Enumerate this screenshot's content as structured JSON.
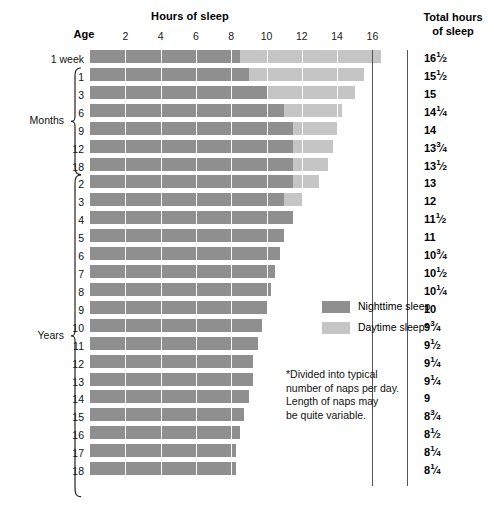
{
  "header": {
    "hours_title": "Hours of sleep",
    "age_title": "Age",
    "total_title_line1": "Total hours",
    "total_title_line2": "of sleep"
  },
  "legend": {
    "nighttime_label": "Nighttime sleep",
    "daytime_label": "Daytime sleep*",
    "nighttime_color": "#8f8f8f",
    "daytime_color": "#c5c5c5"
  },
  "footnote": {
    "line1": "*Divided into typical",
    "line2": "number of naps per day.",
    "line3": "Length of naps may",
    "line4": "be quite variable."
  },
  "groups": [
    {
      "label": "Months",
      "first_row": 1,
      "last_row": 6
    },
    {
      "label": "Years",
      "first_row": 7,
      "last_row": 24
    }
  ],
  "chart_data": {
    "type": "bar",
    "title": "Hours of sleep",
    "xlabel": "Hours of sleep",
    "ylabel": "Age",
    "xlim": [
      0,
      17
    ],
    "xticks": [
      2,
      4,
      6,
      8,
      10,
      12,
      14,
      16
    ],
    "grid": true,
    "stacked": true,
    "legend_position": "middle-right",
    "series": [
      {
        "name": "Nighttime sleep",
        "color": "#8f8f8f"
      },
      {
        "name": "Daytime sleep*",
        "color": "#c5c5c5"
      }
    ],
    "categories": [
      "1 week",
      "1",
      "3",
      "6",
      "9",
      "12",
      "18",
      "2",
      "3",
      "4",
      "5",
      "6",
      "7",
      "8",
      "9",
      "10",
      "11",
      "12",
      "13",
      "14",
      "15",
      "16",
      "17",
      "18"
    ],
    "rows": [
      {
        "age": "1 week",
        "group": "",
        "night": 8.5,
        "day": 8,
        "total": 16.5,
        "total_label": "16½",
        "total_whole": "16",
        "total_num": "1",
        "total_den": "2"
      },
      {
        "age": "1",
        "group": "Months",
        "night": 9,
        "day": 6.5,
        "total": 15.5,
        "total_label": "15½",
        "total_whole": "15",
        "total_num": "1",
        "total_den": "2"
      },
      {
        "age": "3",
        "group": "Months",
        "night": 10,
        "day": 5,
        "total": 15,
        "total_label": "15",
        "total_whole": "15",
        "total_num": "",
        "total_den": ""
      },
      {
        "age": "6",
        "group": "Months",
        "night": 11,
        "day": 3.25,
        "total": 14.25,
        "total_label": "14¼",
        "total_whole": "14",
        "total_num": "1",
        "total_den": "4"
      },
      {
        "age": "9",
        "group": "Months",
        "night": 11.5,
        "day": 2.5,
        "total": 14,
        "total_label": "14",
        "total_whole": "14",
        "total_num": "",
        "total_den": ""
      },
      {
        "age": "12",
        "group": "Months",
        "night": 11.5,
        "day": 2.25,
        "total": 13.75,
        "total_label": "13¾",
        "total_whole": "13",
        "total_num": "3",
        "total_den": "4"
      },
      {
        "age": "18",
        "group": "Months",
        "night": 11.5,
        "day": 2,
        "total": 13.5,
        "total_label": "13½",
        "total_whole": "13",
        "total_num": "1",
        "total_den": "2"
      },
      {
        "age": "2",
        "group": "Years",
        "night": 11.5,
        "day": 1.5,
        "total": 13,
        "total_label": "13",
        "total_whole": "13",
        "total_num": "",
        "total_den": ""
      },
      {
        "age": "3",
        "group": "Years",
        "night": 11,
        "day": 1,
        "total": 12,
        "total_label": "12",
        "total_whole": "12",
        "total_num": "",
        "total_den": ""
      },
      {
        "age": "4",
        "group": "Years",
        "night": 11.5,
        "day": 0,
        "total": 11.5,
        "total_label": "11½",
        "total_whole": "11",
        "total_num": "1",
        "total_den": "2"
      },
      {
        "age": "5",
        "group": "Years",
        "night": 11,
        "day": 0,
        "total": 11,
        "total_label": "11",
        "total_whole": "11",
        "total_num": "",
        "total_den": ""
      },
      {
        "age": "6",
        "group": "Years",
        "night": 10.75,
        "day": 0,
        "total": 10.75,
        "total_label": "10¾",
        "total_whole": "10",
        "total_num": "3",
        "total_den": "4"
      },
      {
        "age": "7",
        "group": "Years",
        "night": 10.5,
        "day": 0,
        "total": 10.5,
        "total_label": "10½",
        "total_whole": "10",
        "total_num": "1",
        "total_den": "2"
      },
      {
        "age": "8",
        "group": "Years",
        "night": 10.25,
        "day": 0,
        "total": 10.25,
        "total_label": "10¼",
        "total_whole": "10",
        "total_num": "1",
        "total_den": "4"
      },
      {
        "age": "9",
        "group": "Years",
        "night": 10,
        "day": 0,
        "total": 10,
        "total_label": "10",
        "total_whole": "10",
        "total_num": "",
        "total_den": ""
      },
      {
        "age": "10",
        "group": "Years",
        "night": 9.75,
        "day": 0,
        "total": 9.75,
        "total_label": "9¾",
        "total_whole": "9",
        "total_num": "3",
        "total_den": "4"
      },
      {
        "age": "11",
        "group": "Years",
        "night": 9.5,
        "day": 0,
        "total": 9.5,
        "total_label": "9½",
        "total_whole": "9",
        "total_num": "1",
        "total_den": "2"
      },
      {
        "age": "12",
        "group": "Years",
        "night": 9.25,
        "day": 0,
        "total": 9.25,
        "total_label": "9¼",
        "total_whole": "9",
        "total_num": "1",
        "total_den": "4"
      },
      {
        "age": "13",
        "group": "Years",
        "night": 9.25,
        "day": 0,
        "total": 9.25,
        "total_label": "9¼",
        "total_whole": "9",
        "total_num": "1",
        "total_den": "4"
      },
      {
        "age": "14",
        "group": "Years",
        "night": 9,
        "day": 0,
        "total": 9,
        "total_label": "9",
        "total_whole": "9",
        "total_num": "",
        "total_den": ""
      },
      {
        "age": "15",
        "group": "Years",
        "night": 8.75,
        "day": 0,
        "total": 8.75,
        "total_label": "8¾",
        "total_whole": "8",
        "total_num": "3",
        "total_den": "4"
      },
      {
        "age": "16",
        "group": "Years",
        "night": 8.5,
        "day": 0,
        "total": 8.5,
        "total_label": "8½",
        "total_whole": "8",
        "total_num": "1",
        "total_den": "2"
      },
      {
        "age": "17",
        "group": "Years",
        "night": 8.25,
        "day": 0,
        "total": 8.25,
        "total_label": "8¼",
        "total_whole": "8",
        "total_num": "1",
        "total_den": "4"
      },
      {
        "age": "18",
        "group": "Years",
        "night": 8.25,
        "day": 0,
        "total": 8.25,
        "total_label": "8¼",
        "total_whole": "8",
        "total_num": "1",
        "total_den": "4"
      }
    ]
  }
}
